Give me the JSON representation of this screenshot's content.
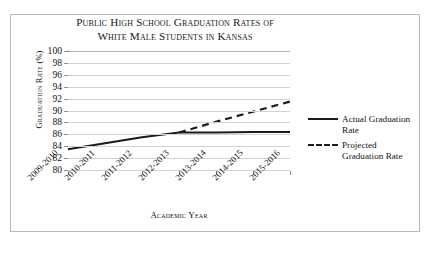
{
  "chart_data": {
    "type": "line",
    "title": "Public High School Graduation Rates of White Male Students in Kansas",
    "title_lines": [
      "Public High School Graduation Rates of",
      "White Male Students in Kansas"
    ],
    "xlabel": "Academic Year",
    "ylabel": "Graduation Rate (%)",
    "categories": [
      "2009-2010",
      "2010-2011",
      "2011-2012",
      "2012-2013",
      "2013-2014",
      "2014-2015",
      "2015-2016"
    ],
    "ylim": [
      80,
      100
    ],
    "ytick_step": 2,
    "yticks": [
      100,
      98,
      96,
      94,
      92,
      90,
      88,
      86,
      84,
      82,
      80
    ],
    "grid": "horizontal",
    "legend_position": "right",
    "series": [
      {
        "name": "Actual Graduation Rate",
        "style": "solid",
        "color": "#1b1b1b",
        "values": [
          83.5,
          84.5,
          85.5,
          86.3,
          86.3,
          86.4,
          86.4
        ]
      },
      {
        "name": "Projected Graduation Rate",
        "style": "dashed",
        "color": "#1b1b1b",
        "values": [
          null,
          null,
          null,
          86.3,
          88.1,
          89.8,
          91.5
        ]
      }
    ]
  },
  "legend": {
    "items": [
      {
        "label": "Actual Graduation Rate",
        "style": "solid"
      },
      {
        "label": "Projected Graduation Rate",
        "style": "dashed"
      }
    ]
  }
}
